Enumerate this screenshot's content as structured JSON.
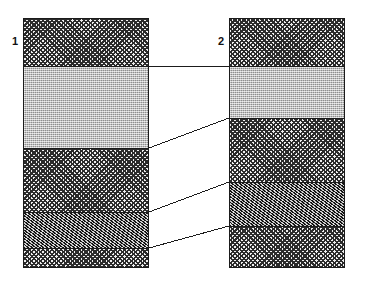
{
  "figure": {
    "type": "stratigraphic-correlation-diagram",
    "credit": "Source: Nicole Webb",
    "background_color": "#ffffff",
    "line_color": "#1b1b1b"
  },
  "columns": [
    {
      "label": "1",
      "name": "section-column-1",
      "x": 23,
      "y": 18,
      "width": 126,
      "height": 250,
      "beds": [
        {
          "name": "bed-1-1",
          "pattern": "crosshatch",
          "fill_color": "#6f6f6f",
          "top": 18,
          "bottom": 66,
          "thickness": 48
        },
        {
          "name": "bed-1-2",
          "pattern": "stipple-light",
          "fill_color": "#b4b4b4",
          "top": 66,
          "bottom": 148,
          "thickness": 82
        },
        {
          "name": "bed-1-3",
          "pattern": "crosshatch",
          "fill_color": "#6f6f6f",
          "top": 148,
          "bottom": 212,
          "thickness": 64
        },
        {
          "name": "bed-1-4",
          "pattern": "speckle-dark",
          "fill_color": "#3c3c3c",
          "top": 212,
          "bottom": 248,
          "thickness": 36
        },
        {
          "name": "bed-1-5",
          "pattern": "crosshatch",
          "fill_color": "#6f6f6f",
          "top": 248,
          "bottom": 268,
          "thickness": 20
        }
      ]
    },
    {
      "label": "2",
      "name": "section-column-2",
      "x": 229,
      "y": 18,
      "width": 116,
      "height": 250,
      "beds": [
        {
          "name": "bed-2-1",
          "pattern": "crosshatch",
          "fill_color": "#6f6f6f",
          "top": 18,
          "bottom": 66,
          "thickness": 48
        },
        {
          "name": "bed-2-2",
          "pattern": "stipple-light",
          "fill_color": "#b4b4b4",
          "top": 66,
          "bottom": 118,
          "thickness": 52
        },
        {
          "name": "bed-2-3",
          "pattern": "crosshatch",
          "fill_color": "#6f6f6f",
          "top": 118,
          "bottom": 182,
          "thickness": 64
        },
        {
          "name": "bed-2-4",
          "pattern": "speckle-dark",
          "fill_color": "#3c3c3c",
          "top": 182,
          "bottom": 226,
          "thickness": 44
        },
        {
          "name": "bed-2-5",
          "pattern": "crosshatch",
          "fill_color": "#6f6f6f",
          "top": 226,
          "bottom": 268,
          "thickness": 42
        }
      ]
    }
  ],
  "correlation_lines": [
    {
      "name": "correlation-line-1",
      "x1": 149,
      "y1": 66,
      "x2": 229,
      "y2": 66
    },
    {
      "name": "correlation-line-2",
      "x1": 149,
      "y1": 148,
      "x2": 229,
      "y2": 118
    },
    {
      "name": "correlation-line-3",
      "x1": 149,
      "y1": 212,
      "x2": 229,
      "y2": 182
    },
    {
      "name": "correlation-line-4",
      "x1": 149,
      "y1": 248,
      "x2": 229,
      "y2": 226
    }
  ],
  "labels": {
    "column_1": {
      "text": "1",
      "x": 12,
      "y": 36
    },
    "column_2": {
      "text": "2",
      "x": 218,
      "y": 36
    }
  }
}
